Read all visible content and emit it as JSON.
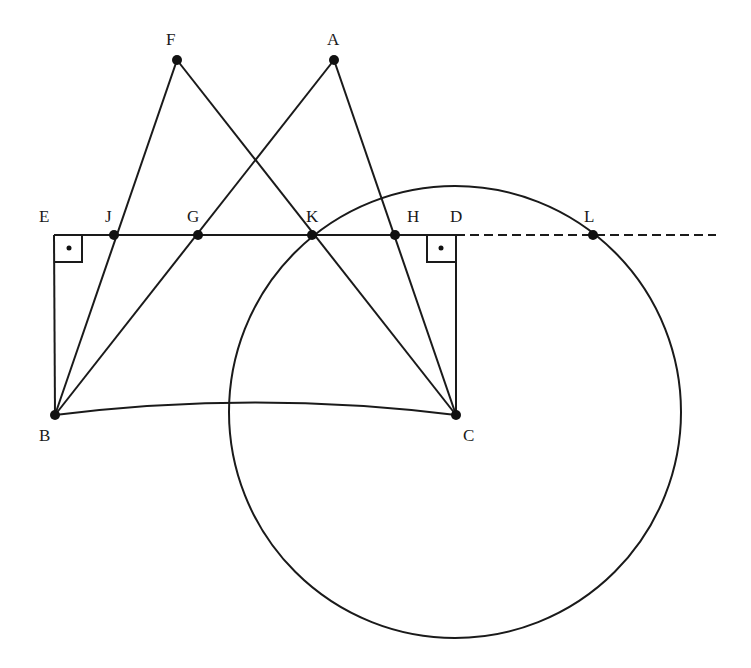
{
  "diagram": {
    "type": "geometry-construction",
    "colors": {
      "stroke": "#1a1a1a",
      "point": "#111111",
      "background": "#ffffff"
    },
    "points": [
      {
        "id": "F",
        "x": 177,
        "y": 60
      },
      {
        "id": "A",
        "x": 334,
        "y": 60
      },
      {
        "id": "E",
        "x": 54,
        "y": 235
      },
      {
        "id": "J",
        "x": 114,
        "y": 235
      },
      {
        "id": "G",
        "x": 198,
        "y": 235
      },
      {
        "id": "K",
        "x": 312,
        "y": 235
      },
      {
        "id": "H",
        "x": 395,
        "y": 235
      },
      {
        "id": "D",
        "x": 456,
        "y": 235
      },
      {
        "id": "L",
        "x": 593,
        "y": 235
      },
      {
        "id": "B",
        "x": 55,
        "y": 415
      },
      {
        "id": "C",
        "x": 456,
        "y": 415
      }
    ],
    "labels": {
      "F": "F",
      "A": "A",
      "E": "E",
      "J": "J",
      "G": "G",
      "K": "K",
      "H": "H",
      "D": "D",
      "L": "L",
      "B": "B",
      "C": "C"
    },
    "segments": [
      [
        "F",
        "B"
      ],
      [
        "F",
        "C"
      ],
      [
        "A",
        "B"
      ],
      [
        "A",
        "C"
      ],
      [
        "E",
        "D"
      ],
      [
        "E",
        "B"
      ],
      [
        "D",
        "C"
      ]
    ],
    "dashed_ray": {
      "from": "D",
      "through": "L",
      "end_x": 716
    },
    "arc": {
      "from": "B",
      "to": "C",
      "bulge": "up"
    },
    "circle": {
      "center": "C",
      "radius": 226
    },
    "right_angles": [
      "E",
      "D"
    ]
  }
}
